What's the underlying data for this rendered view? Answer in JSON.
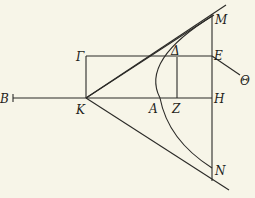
{
  "diagram": {
    "type": "geometric construction (parabola with tangents)",
    "labels": {
      "B": "B",
      "K": "K",
      "Gamma": "Γ",
      "Delta": "Δ",
      "A": "A",
      "Z": "Z",
      "E": "E",
      "H": "H",
      "M": "M",
      "N": "N",
      "Theta": "Θ"
    },
    "colors": {
      "background": "#f7f5e8",
      "ink": "#2b2a27"
    }
  }
}
